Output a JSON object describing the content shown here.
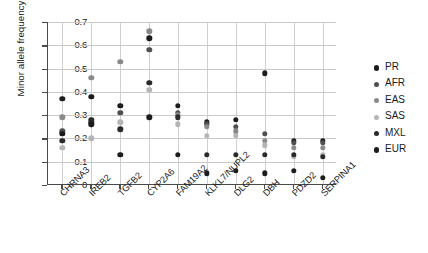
{
  "chart_data": {
    "type": "scatter",
    "title": "",
    "xlabel": "",
    "ylabel": "Minor allele frequency",
    "ylim": [
      0,
      0.7
    ],
    "ytick_labels": [
      "0.7",
      "0.6",
      "0.5",
      "0.4",
      "0.3",
      "0.2",
      "0.1",
      "0"
    ],
    "ytick_values": [
      0.7,
      0.6,
      0.5,
      0.4,
      0.3,
      0.2,
      0.1,
      0
    ],
    "grid": "horizontal-and-vertical",
    "legend_position": "right",
    "categories": [
      "CHRNA3",
      "IREB2",
      "TGFB2",
      "CYP2A6",
      "FAM19A2",
      "KLKL7/NUPL2",
      "DLG2",
      "DBH",
      "PDZD2",
      "SERPINA1"
    ],
    "series": [
      {
        "name": "PR",
        "color": "#1c1c1c",
        "values": [
          0.37,
          0.38,
          0.34,
          0.63,
          0.34,
          0.27,
          0.28,
          0.48,
          0.19,
          0.19
        ]
      },
      {
        "name": "AFR",
        "color": "#4f4f4f",
        "values": [
          0.23,
          0.27,
          0.31,
          0.58,
          0.31,
          0.26,
          0.25,
          0.22,
          0.18,
          0.18
        ]
      },
      {
        "name": "EAS",
        "color": "#8a8a8a",
        "values": [
          0.29,
          0.46,
          0.53,
          0.66,
          0.3,
          0.25,
          0.23,
          0.19,
          0.16,
          0.16
        ]
      },
      {
        "name": "SAS",
        "color": "#b5b5b5",
        "values": [
          0.16,
          0.2,
          0.27,
          0.41,
          0.26,
          0.21,
          0.21,
          0.17,
          0.12,
          0.13
        ]
      },
      {
        "name": "MXL",
        "color": "#2a2a2a",
        "values": [
          0.19,
          0.28,
          0.24,
          0.44,
          0.29,
          0.13,
          0.13,
          0.13,
          0.13,
          0.12
        ]
      },
      {
        "name": "EUR",
        "color": "#1c1c1c",
        "values": [
          0.22,
          0.26,
          0.13,
          0.29,
          0.13,
          0.05,
          0.06,
          0.05,
          0.06,
          0.03
        ]
      }
    ]
  },
  "legend": {
    "items": [
      {
        "label": "PR"
      },
      {
        "label": "AFR"
      },
      {
        "label": "EAS"
      },
      {
        "label": "SAS"
      },
      {
        "label": "MXL"
      },
      {
        "label": "EUR"
      }
    ]
  }
}
